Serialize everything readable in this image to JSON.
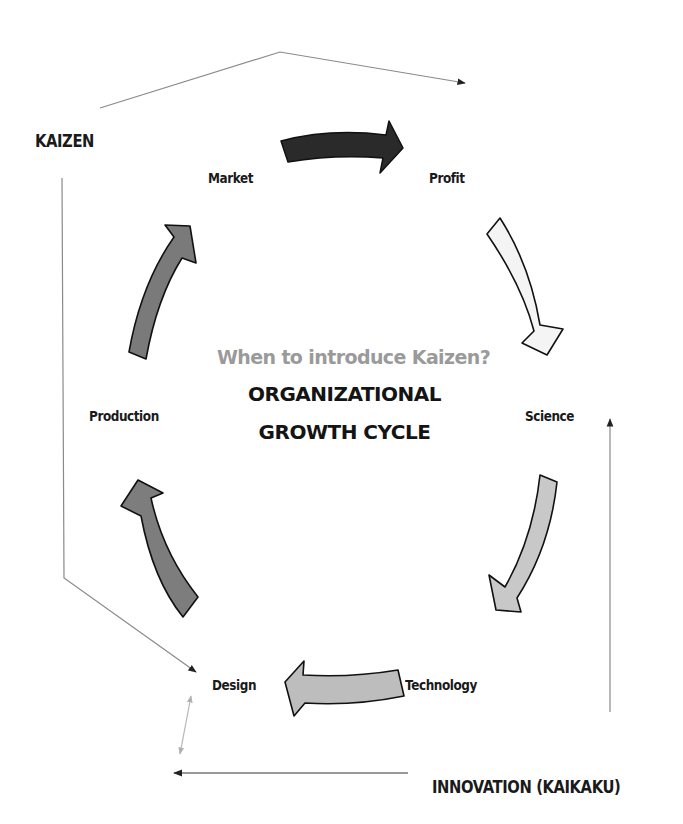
{
  "diagram": {
    "question": "When to introduce Kaizen?",
    "title_line1": "ORGANIZATIONAL",
    "title_line2": "GROWTH CYCLE",
    "side_labels": {
      "kaizen": "KAIZEN",
      "innovation": "INNOVATION (KAIKAKU)"
    },
    "cycle_nodes": [
      {
        "id": "market",
        "label": "Market"
      },
      {
        "id": "profit",
        "label": "Profit"
      },
      {
        "id": "science",
        "label": "Science"
      },
      {
        "id": "technology",
        "label": "Technology"
      },
      {
        "id": "design",
        "label": "Design"
      },
      {
        "id": "production",
        "label": "Production"
      }
    ],
    "cycle_arrows": [
      {
        "from": "Market",
        "to": "Profit",
        "fill": "#2a2a2a"
      },
      {
        "from": "Profit",
        "to": "Science",
        "fill": "#f4f4f4"
      },
      {
        "from": "Science",
        "to": "Technology",
        "fill": "#c8c8c8"
      },
      {
        "from": "Technology",
        "to": "Design",
        "fill": "#bdbdbd"
      },
      {
        "from": "Design",
        "to": "Production",
        "fill": "#7d7d7d"
      },
      {
        "from": "Production",
        "to": "Market",
        "fill": "#7a7a7a"
      }
    ],
    "connector_lines": [
      {
        "name": "kaizen-to-profit",
        "from": "KAIZEN",
        "to": "Profit"
      },
      {
        "name": "kaizen-to-design",
        "from": "KAIZEN",
        "to": "Design"
      },
      {
        "name": "innovation-to-design",
        "from": "INNOVATION (KAIKAKU)",
        "to": "Design"
      },
      {
        "name": "innovation-to-science",
        "from": "INNOVATION (KAIKAKU)",
        "to": "Science"
      },
      {
        "name": "design-bidirectional",
        "from": "Design",
        "to": "INNOVATION (KAIKAKU)"
      }
    ]
  }
}
